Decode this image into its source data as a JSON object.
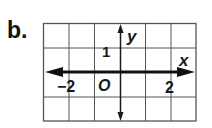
{
  "problem_label": "b.",
  "graph": {
    "x_axis_label": "x",
    "y_axis_label": "y",
    "origin_label": "O",
    "tick_labels": {
      "x_negative": "−2",
      "x_positive": "2",
      "y_positive": "1"
    },
    "grid": {
      "columns": 6,
      "rows": 4,
      "x_range": [
        -3,
        3
      ],
      "y_range": [
        -2,
        2
      ]
    },
    "highlighted_line": {
      "equation": "y = 0",
      "description": "line drawn along the x-axis with arrows at both ends"
    },
    "colors": {
      "grid": "#555555",
      "axis": "#1a1a1a",
      "line": "#111111"
    }
  }
}
